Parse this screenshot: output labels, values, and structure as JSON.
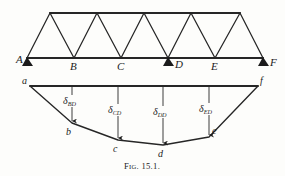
{
  "figure": {
    "caption_prefix": "F",
    "caption_smallcaps": "IG",
    "caption_suffix": ". 15.1.",
    "caption_full": "FIG. 15.1.",
    "ink_color": "#262626",
    "background_color": "#fdfdfb"
  },
  "truss": {
    "name": "warren-truss",
    "bottom_chord": {
      "y": 58,
      "x_start": 27,
      "x_end": 263
    },
    "top_chord": {
      "y": 13,
      "x_start": 50,
      "x_end": 240
    },
    "bottom_nodes": [
      {
        "label": "A",
        "x": 27,
        "y": 58,
        "label_x": 16,
        "label_y": 62,
        "support": true
      },
      {
        "label": "B",
        "x": 74,
        "y": 58,
        "label_x": 70,
        "label_y": 69,
        "support": false
      },
      {
        "label": "C",
        "x": 121,
        "y": 58,
        "label_x": 117,
        "label_y": 69,
        "support": false
      },
      {
        "label": "D",
        "x": 168,
        "y": 58,
        "label_x": 172,
        "label_y": 66,
        "support": true
      },
      {
        "label": "E",
        "x": 215,
        "y": 58,
        "label_x": 211,
        "label_y": 69,
        "support": false
      },
      {
        "label": "F",
        "x": 263,
        "y": 58,
        "label_x": 270,
        "label_y": 64,
        "support": true
      }
    ],
    "top_nodes": [
      {
        "x": 50,
        "y": 13
      },
      {
        "x": 97,
        "y": 13
      },
      {
        "x": 144,
        "y": 13
      },
      {
        "x": 191,
        "y": 13
      },
      {
        "x": 240,
        "y": 13
      }
    ],
    "support_count": 3,
    "support_labels": [
      "A",
      "D",
      "F"
    ]
  },
  "deflection": {
    "name": "deflection-diagram",
    "datum_line": {
      "label_left": "a",
      "label_right": "f",
      "x_start": 30,
      "x_end": 258,
      "y": 86,
      "label_left_x": 22,
      "label_left_y": 82,
      "label_right_x": 260,
      "label_right_y": 82
    },
    "curve_points": [
      {
        "label": "a",
        "x": 30,
        "y": 86,
        "label_x": 22,
        "label_y": 82
      },
      {
        "label": "b",
        "x": 72,
        "y": 123,
        "label_x": 66,
        "label_y": 134
      },
      {
        "label": "c",
        "x": 118,
        "y": 140,
        "label_x": 113,
        "label_y": 151
      },
      {
        "label": "d",
        "x": 163,
        "y": 145,
        "label_x": 158,
        "label_y": 156
      },
      {
        "label": "e",
        "x": 209,
        "y": 137,
        "label_x": 211,
        "label_y": 133
      },
      {
        "label": "f",
        "x": 258,
        "y": 86,
        "label_x": 260,
        "label_y": 82
      }
    ],
    "ordinates": [
      {
        "symbol": "δ",
        "subscript": "BD",
        "full": "δBD",
        "x": 72,
        "y_top": 86,
        "y_bottom": 123,
        "text_x": 63,
        "text_y": 104
      },
      {
        "symbol": "δ",
        "subscript": "CD",
        "full": "δCD",
        "x": 118,
        "y_top": 86,
        "y_bottom": 140,
        "text_x": 108,
        "text_y": 113
      },
      {
        "symbol": "δ",
        "subscript": "DD",
        "full": "δDD",
        "x": 163,
        "y_top": 86,
        "y_bottom": 145,
        "text_x": 153,
        "text_y": 115
      },
      {
        "symbol": "δ",
        "subscript": "ED",
        "full": "δED",
        "x": 209,
        "y_top": 86,
        "y_bottom": 137,
        "text_x": 199,
        "text_y": 112
      }
    ]
  }
}
